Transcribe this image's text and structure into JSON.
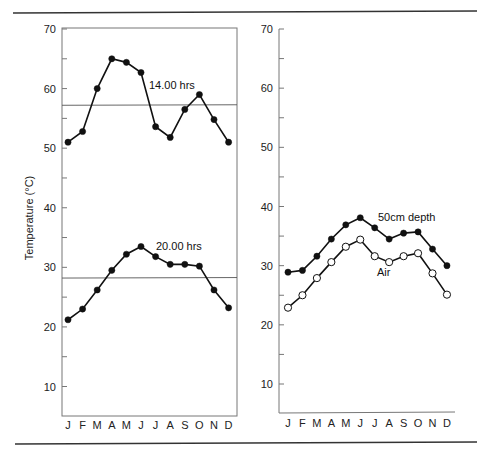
{
  "figure": {
    "ylabel": "Temperature (°C)",
    "months": [
      "J",
      "F",
      "M",
      "A",
      "M",
      "J",
      "J",
      "A",
      "S",
      "O",
      "N",
      "D"
    ],
    "yticks": [
      10,
      20,
      30,
      40,
      50,
      60,
      70
    ]
  },
  "chart_data": [
    {
      "type": "line",
      "title": "",
      "xlabel": "",
      "ylabel": "Temperature (°C)",
      "categories": [
        "J",
        "F",
        "M",
        "A",
        "M",
        "J",
        "J",
        "A",
        "S",
        "O",
        "N",
        "D"
      ],
      "ylim": [
        5,
        70
      ],
      "yticks": [
        10,
        20,
        30,
        40,
        50,
        60,
        70
      ],
      "grid": false,
      "series": [
        {
          "name": "14.00 hrs",
          "marker": "filled-circle",
          "values": [
            51.0,
            52.8,
            60.0,
            65.0,
            64.4,
            62.7,
            53.6,
            51.8,
            56.5,
            59.0,
            54.8,
            51.0
          ],
          "mean_line": 57.2
        },
        {
          "name": "20.00 hrs",
          "marker": "filled-circle",
          "values": [
            21.2,
            23.0,
            26.2,
            29.5,
            32.2,
            33.5,
            31.8,
            30.5,
            30.5,
            30.2,
            26.2,
            23.2
          ],
          "mean_line": 28.2
        }
      ],
      "annotations": [
        "14.00 hrs",
        "20.00 hrs"
      ]
    },
    {
      "type": "line",
      "title": "",
      "xlabel": "",
      "ylabel": "",
      "categories": [
        "J",
        "F",
        "M",
        "A",
        "M",
        "J",
        "J",
        "A",
        "S",
        "O",
        "N",
        "D"
      ],
      "ylim": [
        5,
        70
      ],
      "yticks": [
        10,
        20,
        30,
        40,
        50,
        60,
        70
      ],
      "grid": false,
      "series": [
        {
          "name": "50cm depth",
          "marker": "filled-circle",
          "values": [
            28.9,
            29.2,
            31.6,
            34.5,
            36.9,
            38.1,
            36.4,
            34.5,
            35.5,
            35.7,
            32.8,
            30.0
          ]
        },
        {
          "name": "Air",
          "marker": "open-circle",
          "values": [
            22.9,
            25.0,
            27.9,
            30.6,
            33.2,
            34.4,
            31.6,
            30.6,
            31.6,
            32.1,
            28.7,
            25.1
          ]
        }
      ],
      "annotations": [
        "50cm depth",
        "Air"
      ]
    }
  ]
}
